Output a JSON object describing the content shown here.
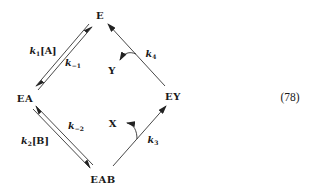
{
  "diagram": {
    "type": "kinetic-mechanism-cycle",
    "equation_number": "(78)",
    "nodes": {
      "E": "E",
      "EA": "EA",
      "EAB": "EAB",
      "EY": "EY"
    },
    "products": {
      "X": "X",
      "Y": "Y"
    },
    "rate_constants": {
      "k1": {
        "symbol": "k",
        "subscript": "1",
        "suffix": "[A]"
      },
      "k_1": {
        "symbol": "k",
        "subscript": "−1",
        "suffix": ""
      },
      "k2": {
        "symbol": "k",
        "subscript": "2",
        "suffix": "[B]"
      },
      "k_2": {
        "symbol": "k",
        "subscript": "−2",
        "suffix": ""
      },
      "k3": {
        "symbol": "k",
        "subscript": "3",
        "suffix": ""
      },
      "k4": {
        "symbol": "k",
        "subscript": "4",
        "suffix": ""
      }
    },
    "edges": [
      {
        "from": "E",
        "to": "EA",
        "label": "k1[A]",
        "reversible": true,
        "reverse_label": "k−1"
      },
      {
        "from": "EA",
        "to": "EAB",
        "label": "k2[B]",
        "reversible": true,
        "reverse_label": "k−2"
      },
      {
        "from": "EAB",
        "to": "EY",
        "label": "k3",
        "reversible": false,
        "releases": "X"
      },
      {
        "from": "EY",
        "to": "E",
        "label": "k4",
        "reversible": false,
        "releases": "Y"
      }
    ],
    "line_color": "#333333"
  }
}
